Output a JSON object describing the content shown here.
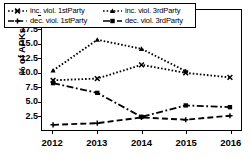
{
  "chart_data": {
    "type": "line",
    "title": "",
    "xlabel": "",
    "ylabel": "% of APKs",
    "x": [
      2012,
      2013,
      2014,
      2015,
      2016
    ],
    "categories": [
      "2012",
      "2013",
      "2014",
      "2015",
      "2016"
    ],
    "xticklabels": [
      "2012",
      "2013",
      "2014",
      "2015",
      "2016"
    ],
    "yticklabels": [
      "2.5",
      "5.0",
      "7.5",
      "10.0",
      "12.5",
      "15.0",
      "17.5",
      "20.0"
    ],
    "ytickvalues": [
      2.5,
      5.0,
      7.5,
      10.0,
      12.5,
      15.0,
      17.5,
      20.0
    ],
    "ylim": [
      0.0,
      21.0
    ],
    "xlim": [
      2011.75,
      2016.25
    ],
    "grid": false,
    "legend_position": "upper-left-inside",
    "series": [
      {
        "name": "inc. viol. 1stParty",
        "style": "dotted",
        "marker": "x",
        "values": [
          8.7,
          9.0,
          11.4,
          10.0,
          9.2
        ]
      },
      {
        "name": "inc. viol. 3rdParty",
        "style": "dotted",
        "marker": "triangle",
        "values": [
          10.4,
          15.8,
          14.2,
          10.3,
          null
        ]
      },
      {
        "name": "dec. viol. 1stParty",
        "style": "dashed",
        "marker": "plus",
        "values": [
          0.9,
          1.2,
          2.2,
          1.8,
          2.5
        ]
      },
      {
        "name": "dec. viol. 3rdParty",
        "style": "dashdot",
        "marker": "square",
        "values": [
          8.2,
          6.5,
          2.3,
          4.3,
          4.0
        ]
      }
    ]
  },
  "legend": {
    "entries": [
      {
        "label": "inc. viol. 1stParty"
      },
      {
        "label": "inc. viol. 3rdParty"
      },
      {
        "label": "dec. viol. 1stParty"
      },
      {
        "label": "dec. viol. 3rdParty"
      }
    ]
  },
  "axes": {
    "ylabel": "% of APKs"
  }
}
